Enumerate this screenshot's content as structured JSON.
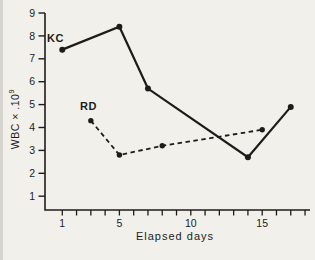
{
  "figure": {
    "background": "#f2f0ea",
    "ink": "#1e1c1a"
  },
  "chart_data": {
    "type": "line",
    "title": "",
    "xlabel": "Elapsed days",
    "ylabel": "WBC × .10⁹",
    "ylabel_base": "WBC × .10",
    "ylabel_exponent": "9",
    "xlim": [
      0,
      18.5
    ],
    "ylim": [
      0,
      9
    ],
    "y_ticks": [
      1,
      2,
      3,
      4,
      5,
      6,
      7,
      8,
      9
    ],
    "x_minor_ticks": [
      1,
      2,
      3,
      4,
      5,
      6,
      7,
      8,
      9,
      10,
      11,
      12,
      13,
      14,
      15,
      16,
      17,
      18
    ],
    "x_labeled_ticks": [
      1,
      5,
      10,
      15
    ],
    "grid": false,
    "legend_position": "inline-labels",
    "series": [
      {
        "name": "KC",
        "style": "solid",
        "x": [
          1,
          5,
          7,
          14,
          17
        ],
        "y": [
          7.4,
          8.4,
          5.7,
          2.7,
          4.9
        ]
      },
      {
        "name": "RD",
        "style": "dashed",
        "x": [
          3,
          5,
          8,
          15
        ],
        "y": [
          4.3,
          2.8,
          3.2,
          3.9
        ]
      }
    ]
  }
}
